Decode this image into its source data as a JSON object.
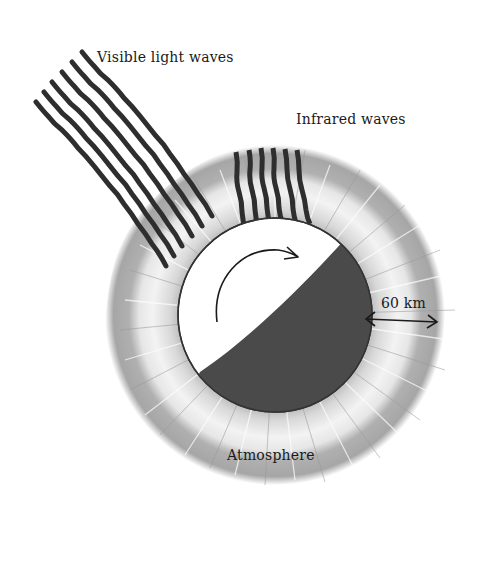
{
  "diagram": {
    "labels": {
      "visible_light": "Visible light waves",
      "infrared": "Infrared waves",
      "distance": "60 km",
      "atmosphere": "Atmosphere"
    },
    "elements": {
      "planet": {
        "shape": "circle",
        "lit_half_color": "#ffffff",
        "dark_half_color": "#4a4a4a",
        "outline_color": "#333333"
      },
      "atmosphere": {
        "shape": "fuzzy-ring",
        "outer_color": "#a8a8a8",
        "inner_color": "#f4f4f4"
      },
      "visible_light_waves": {
        "count": 7,
        "color": "#2e2e2e",
        "style": "wavy"
      },
      "infrared_waves": {
        "count": 6,
        "color": "#2e2e2e",
        "style": "slightly-wavy"
      },
      "rotation_arrow": {
        "direction": "clockwise"
      },
      "distance_arrow": {
        "type": "double-headed",
        "spans": "atmosphere thickness"
      }
    },
    "colors": {
      "background": "#ffffff",
      "ink": "#1a1a1a",
      "atmosphere_gray": "#a8a8a8",
      "planet_dark": "#4a4a4a"
    }
  }
}
